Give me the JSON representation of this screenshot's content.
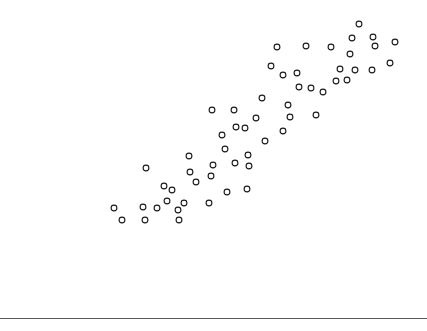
{
  "figure": {
    "width": 427,
    "height": 331,
    "background_color": "#ffffff"
  },
  "axis_rule": {
    "name": "bottom-rule",
    "y": 318,
    "color": "#5a5a5a",
    "thickness": 1
  },
  "footer": {
    "text": ""
  },
  "chart_data": {
    "type": "scatter",
    "title": "",
    "subtitle": "",
    "xlabel": "",
    "ylabel": "",
    "grid": false,
    "legend": null,
    "legend_position": "none",
    "xlim": [
      0,
      427
    ],
    "ylim": [
      0,
      331
    ],
    "marker": {
      "shape": "circle-open",
      "radius_px": 2.9,
      "fill": "#ffffff",
      "edge_color": "#1a1a1a",
      "edge_width_px": 1.1
    },
    "note": "Pixel coordinates measured from the screenshot; y increases downward in image space.",
    "n_points": 57,
    "points_px": [
      [
        114,
        208
      ],
      [
        122,
        220
      ],
      [
        143,
        207
      ],
      [
        145,
        220
      ],
      [
        157,
        208
      ],
      [
        146,
        168
      ],
      [
        164,
        186
      ],
      [
        172,
        190
      ],
      [
        178,
        210
      ],
      [
        179,
        220
      ],
      [
        167,
        201
      ],
      [
        184,
        203
      ],
      [
        189,
        156
      ],
      [
        190,
        172
      ],
      [
        196,
        182
      ],
      [
        209,
        203
      ],
      [
        211,
        176
      ],
      [
        212,
        110
      ],
      [
        213,
        165
      ],
      [
        222,
        135
      ],
      [
        225,
        149
      ],
      [
        227,
        192
      ],
      [
        234,
        110
      ],
      [
        235,
        163
      ],
      [
        236,
        127
      ],
      [
        245,
        128
      ],
      [
        248,
        155
      ],
      [
        249,
        166
      ],
      [
        256,
        118
      ],
      [
        247,
        189
      ],
      [
        262,
        98
      ],
      [
        265,
        141
      ],
      [
        271,
        66
      ],
      [
        277,
        47
      ],
      [
        283,
        75
      ],
      [
        283,
        131
      ],
      [
        288,
        105
      ],
      [
        290,
        117
      ],
      [
        297,
        73
      ],
      [
        299,
        87
      ],
      [
        306,
        46
      ],
      [
        311,
        88
      ],
      [
        316,
        115
      ],
      [
        323,
        92
      ],
      [
        331,
        47
      ],
      [
        336,
        81
      ],
      [
        340,
        69
      ],
      [
        347,
        80
      ],
      [
        350,
        54
      ],
      [
        352,
        38
      ],
      [
        355,
        70
      ],
      [
        359,
        24
      ],
      [
        372,
        70
      ],
      [
        373,
        37
      ],
      [
        375,
        46
      ],
      [
        390,
        63
      ],
      [
        395,
        42
      ]
    ]
  }
}
